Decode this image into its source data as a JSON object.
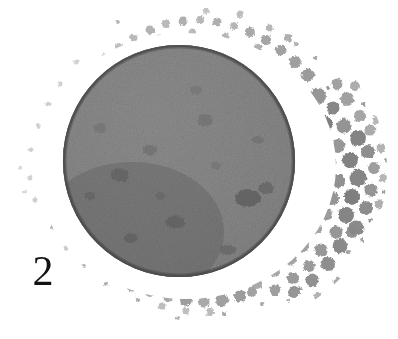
{
  "illustration": {
    "figure_number": "2",
    "caption_label": "2",
    "subject": "ovum-with-granular-corona",
    "background_color": "#ffffff",
    "plate": {
      "width": 398,
      "height": 339
    },
    "central_body": {
      "name": "stippled-sphere",
      "center_x": 179,
      "center_y": 161,
      "radius_x": 116,
      "radius_y": 116,
      "fill_light": "#9a9a9a",
      "fill_mid": "#808080",
      "fill_dark": "#5a5a5a",
      "rim_color": "#4a4a4a",
      "texture": "halftone-stipple",
      "blotches": [
        {
          "cx": 248,
          "cy": 198,
          "rx": 13,
          "ry": 9,
          "shade": "#4e4e4e"
        },
        {
          "cx": 266,
          "cy": 188,
          "rx": 8,
          "ry": 6,
          "shade": "#5a5a5a"
        },
        {
          "cx": 120,
          "cy": 175,
          "rx": 9,
          "ry": 7,
          "shade": "#626262"
        },
        {
          "cx": 150,
          "cy": 150,
          "rx": 7,
          "ry": 5,
          "shade": "#666666"
        },
        {
          "cx": 205,
          "cy": 120,
          "rx": 8,
          "ry": 6,
          "shade": "#6a6a6a"
        },
        {
          "cx": 175,
          "cy": 222,
          "rx": 10,
          "ry": 6,
          "shade": "#5e5e5e"
        },
        {
          "cx": 100,
          "cy": 128,
          "rx": 6,
          "ry": 5,
          "shade": "#6e6e6e"
        },
        {
          "cx": 228,
          "cy": 250,
          "rx": 8,
          "ry": 5,
          "shade": "#5c5c5c"
        }
      ]
    },
    "clear_zone": {
      "name": "perivitelline-space",
      "color": "#ffffff",
      "outer_radius_x": 150,
      "outer_radius_y": 133
    },
    "granular_ring": {
      "name": "corona-radiata",
      "center_x": 190,
      "center_y": 170,
      "inner_radius_x": 150,
      "inner_radius_y": 133,
      "outer_radius_x": 197,
      "outer_radius_y": 168,
      "granule_color_light": "#b9b9b9",
      "granule_color_mid": "#949494",
      "granule_color_dark": "#6d6d6d",
      "density_note": "dense and coarse on right and lower-right, sparse fine speckle on left"
    }
  }
}
